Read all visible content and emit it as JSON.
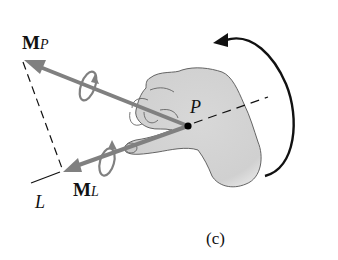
{
  "figure": {
    "caption": "(c)",
    "labels": {
      "moment_p": {
        "main": "M",
        "subscript": "P"
      },
      "moment_l": {
        "main": "M",
        "subscript": "L"
      },
      "point": "P",
      "axis": "L"
    },
    "colors": {
      "vector": "#808080",
      "hand_fill": "#d4d4d4",
      "hand_outline": "#444444",
      "line": "#111111"
    }
  }
}
